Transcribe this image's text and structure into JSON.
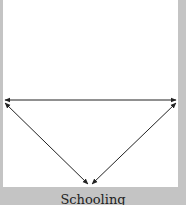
{
  "diagram": {
    "caption": "Schooling",
    "colors": {
      "background": "#c4c4c4",
      "panel": "#ffffff",
      "arrow": "#222222"
    },
    "nodes": [
      {
        "id": "left",
        "x": 4,
        "y": 100
      },
      {
        "id": "right",
        "x": 176,
        "y": 100
      },
      {
        "id": "bottom",
        "x": 90,
        "y": 184
      }
    ],
    "edges": [
      {
        "from": "left",
        "to": "right",
        "bidirectional": true
      },
      {
        "from": "left",
        "to": "bottom",
        "bidirectional": true
      },
      {
        "from": "right",
        "to": "bottom",
        "bidirectional": true
      }
    ]
  }
}
